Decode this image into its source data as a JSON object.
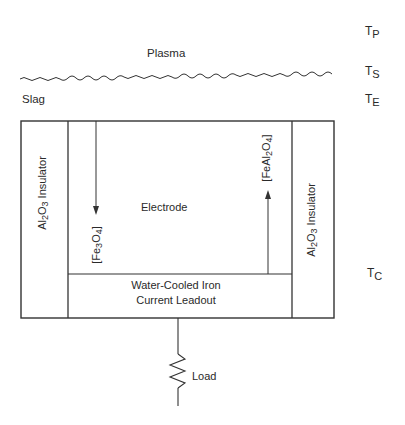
{
  "diagram": {
    "regions": {
      "plasma": "Plasma",
      "slag": "Slag",
      "electrode": "Electrode",
      "leadout_line1": "Water-Cooled Iron",
      "leadout_line2": "Current Leadout",
      "load": "Load"
    },
    "insulator_left": {
      "formula_base": "Al",
      "sub1": "2",
      "mid": "O",
      "sub2": "3",
      "label": "Insulator"
    },
    "insulator_right": {
      "formula_base": "Al",
      "sub1": "2",
      "mid": "O",
      "sub2": "3",
      "label": "Insulator"
    },
    "species_left": {
      "a": "Fe",
      "sub1": "3",
      "b": "O",
      "sub2": "4",
      "arrow_direction": "down"
    },
    "species_right": {
      "a": "FeAl",
      "sub1": "2",
      "b": "O",
      "sub2": "4",
      "arrow_direction": "up"
    },
    "temperatures": [
      {
        "symbol": "T",
        "sub": "P"
      },
      {
        "symbol": "T",
        "sub": "S"
      },
      {
        "symbol": "T",
        "sub": "E"
      },
      {
        "symbol": "T",
        "sub": "C"
      }
    ],
    "line_color": "#333333"
  }
}
